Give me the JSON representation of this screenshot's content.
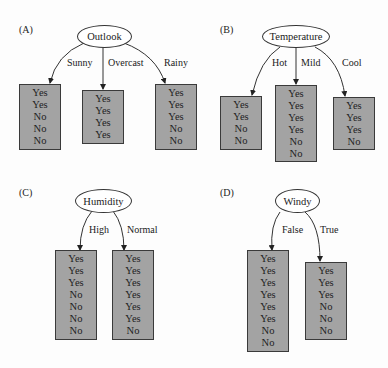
{
  "panels": [
    {
      "label": "(A)",
      "attribute": "Outlook",
      "branches": [
        {
          "label": "Sunny",
          "leaf": [
            "Yes",
            "Yes",
            "No",
            "No",
            "No"
          ]
        },
        {
          "label": "Overcast",
          "leaf": [
            "Yes",
            "Yes",
            "Yes",
            "Yes"
          ]
        },
        {
          "label": "Rainy",
          "leaf": [
            "Yes",
            "Yes",
            "Yes",
            "No",
            "No"
          ]
        }
      ]
    },
    {
      "label": "(B)",
      "attribute": "Temperature",
      "branches": [
        {
          "label": "Hot",
          "leaf": [
            "Yes",
            "Yes",
            "No",
            "No"
          ]
        },
        {
          "label": "Mild",
          "leaf": [
            "Yes",
            "Yes",
            "Yes",
            "Yes",
            "No",
            "No"
          ]
        },
        {
          "label": "Cool",
          "leaf": [
            "Yes",
            "Yes",
            "Yes",
            "No"
          ]
        }
      ]
    },
    {
      "label": "(C)",
      "attribute": "Humidity",
      "branches": [
        {
          "label": "High",
          "leaf": [
            "Yes",
            "Yes",
            "Yes",
            "No",
            "No",
            "No",
            "No"
          ]
        },
        {
          "label": "Normal",
          "leaf": [
            "Yes",
            "Yes",
            "Yes",
            "Yes",
            "Yes",
            "Yes",
            "No"
          ]
        }
      ]
    },
    {
      "label": "(D)",
      "attribute": "Windy",
      "branches": [
        {
          "label": "False",
          "leaf": [
            "Yes",
            "Yes",
            "Yes",
            "Yes",
            "Yes",
            "Yes",
            "No",
            "No"
          ]
        },
        {
          "label": "True",
          "leaf": [
            "Yes",
            "Yes",
            "Yes",
            "No",
            "No",
            "No"
          ]
        }
      ]
    }
  ]
}
